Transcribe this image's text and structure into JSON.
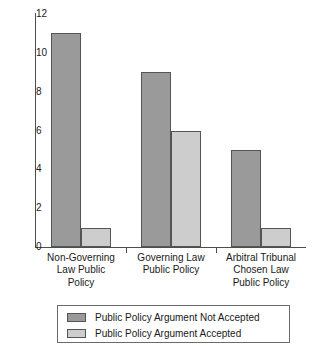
{
  "chart_data": {
    "type": "bar",
    "title": "",
    "xlabel": "",
    "ylabel": "",
    "ylim": [
      0,
      12
    ],
    "yticks": [
      0,
      2,
      4,
      6,
      8,
      10,
      12
    ],
    "grid": false,
    "legend_position": "bottom",
    "categories": [
      "Non-Governing Law Public Policy",
      "Governing Law Public Policy",
      "Arbitral Tribunal Chosen Law Public Policy"
    ],
    "category_lines": [
      [
        "Non-Governing",
        "Law Public",
        "Policy"
      ],
      [
        "Governing Law",
        "Public Policy"
      ],
      [
        "Arbitral Tribunal",
        "Chosen Law",
        "Public Policy"
      ]
    ],
    "series": [
      {
        "name": "Public Policy Argument Not Accepted",
        "color": "#9a9a9a",
        "values": [
          11,
          9,
          5
        ]
      },
      {
        "name": "Public Policy Argument Accepted",
        "color": "#cdcdcd",
        "values": [
          1,
          6,
          1
        ]
      }
    ]
  },
  "legend": {
    "items": [
      {
        "label": "Public Policy Argument Not Accepted",
        "color": "#9a9a9a"
      },
      {
        "label": "Public Policy Argument Accepted",
        "color": "#cdcdcd"
      }
    ]
  },
  "axis": {
    "y_tick_labels": [
      "0",
      "2",
      "4",
      "6",
      "8",
      "10",
      "12"
    ]
  }
}
